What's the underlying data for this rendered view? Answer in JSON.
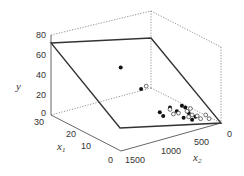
{
  "chart_data": {
    "type": "scatter3d",
    "title": "",
    "axes": {
      "x1": {
        "label": "x",
        "label_sub": "1",
        "range": [
          0,
          30
        ],
        "ticks": [
          "0",
          "10",
          "20",
          "30"
        ]
      },
      "x2": {
        "label": "x",
        "label_sub": "2",
        "range": [
          0,
          1500
        ],
        "ticks": [
          "0",
          "500",
          "1000",
          "1500"
        ]
      },
      "y": {
        "label": "y",
        "range": [
          0,
          80
        ],
        "ticks": [
          "0",
          "20",
          "40",
          "60",
          "80"
        ]
      }
    },
    "plane": {
      "description": "fitted regression plane",
      "corners": [
        {
          "x1": 30,
          "x2": 0,
          "y": 72
        },
        {
          "x1": 0,
          "x2": 0,
          "y": 72
        },
        {
          "x1": 0,
          "x2": 1500,
          "y": 0
        },
        {
          "x1": 30,
          "x2": 1500,
          "y": 0
        }
      ]
    },
    "series": [
      {
        "name": "above plane",
        "marker": "filled",
        "points": [
          {
            "px": 0.41,
            "py": 0.35
          },
          {
            "px": 0.53,
            "py": 0.58
          },
          {
            "px": 0.7,
            "py": 0.78
          },
          {
            "px": 0.64,
            "py": 0.83
          },
          {
            "px": 0.66,
            "py": 0.87
          },
          {
            "px": 0.77,
            "py": 0.76
          },
          {
            "px": 0.79,
            "py": 0.78
          },
          {
            "px": 0.74,
            "py": 0.82
          },
          {
            "px": 0.81,
            "py": 0.84
          },
          {
            "px": 0.78,
            "py": 0.89
          },
          {
            "px": 0.85,
            "py": 0.88
          },
          {
            "px": 0.83,
            "py": 0.91
          }
        ]
      },
      {
        "name": "below plane",
        "marker": "open",
        "points": [
          {
            "px": 0.56,
            "py": 0.55
          },
          {
            "px": 0.7,
            "py": 0.8
          },
          {
            "px": 0.72,
            "py": 0.85
          },
          {
            "px": 0.75,
            "py": 0.84
          },
          {
            "px": 0.8,
            "py": 0.82
          },
          {
            "px": 0.82,
            "py": 0.79
          },
          {
            "px": 0.83,
            "py": 0.86
          },
          {
            "px": 0.86,
            "py": 0.87
          },
          {
            "px": 0.88,
            "py": 0.9
          },
          {
            "px": 0.91,
            "py": 0.86
          },
          {
            "px": 0.93,
            "py": 0.9
          },
          {
            "px": 0.81,
            "py": 0.88
          }
        ]
      }
    ]
  }
}
